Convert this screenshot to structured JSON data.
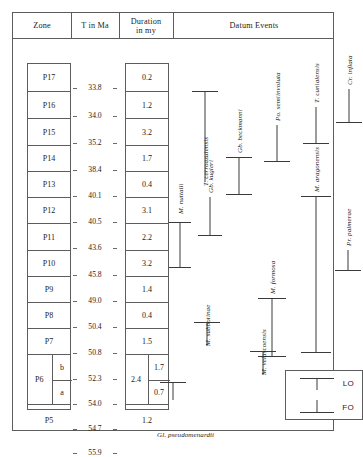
{
  "figure": {
    "kind": "biostratigraphic-zonation-chart"
  },
  "table": {
    "headers": {
      "zone": "Zone",
      "age": "T in Ma",
      "duration": "Duration in my",
      "duration_line1": "Duration",
      "duration_line2": "in my",
      "datum": "Datum Events"
    },
    "zones": [
      {
        "label": "P17",
        "top_ma": 33.8,
        "base_ma": 34.0,
        "duration": "0.2"
      },
      {
        "label": "P16",
        "top_ma": 34.0,
        "base_ma": 35.2,
        "duration": "1.2"
      },
      {
        "label": "P15",
        "top_ma": 35.2,
        "base_ma": 38.4,
        "duration": "3.2"
      },
      {
        "label": "P14",
        "top_ma": 38.4,
        "base_ma": 40.1,
        "duration": "1.7"
      },
      {
        "label": "P13",
        "top_ma": 40.1,
        "base_ma": 40.5,
        "duration": "0.4"
      },
      {
        "label": "P12",
        "top_ma": 40.5,
        "base_ma": 43.6,
        "duration": "3.1"
      },
      {
        "label": "P11",
        "top_ma": 43.6,
        "base_ma": 45.8,
        "duration": "2.2"
      },
      {
        "label": "P10",
        "top_ma": 45.8,
        "base_ma": 49.0,
        "duration": "3.2"
      },
      {
        "label": "P9",
        "top_ma": 49.0,
        "base_ma": 50.4,
        "duration": "1.4"
      },
      {
        "label": "P8",
        "top_ma": 50.4,
        "base_ma": 50.8,
        "duration": "0.4"
      },
      {
        "label": "P7",
        "top_ma": 50.8,
        "base_ma": 52.3,
        "duration": "1.5"
      },
      {
        "label": "P6",
        "top_ma": 52.3,
        "base_ma": 54.7,
        "duration": "2.4",
        "subzones": [
          {
            "label": "b",
            "top_ma": 52.3,
            "base_ma": 54.0,
            "duration": "1.7"
          },
          {
            "label": "a",
            "top_ma": 54.0,
            "base_ma": 54.7,
            "duration": "0.7"
          }
        ]
      },
      {
        "label": "P5",
        "top_ma": 54.7,
        "base_ma": 55.9,
        "duration": "1.2"
      }
    ],
    "age_ticks": [
      "33.8",
      "34.0",
      "35.2",
      "38.4",
      "40.1",
      "40.5",
      "43.6",
      "45.8",
      "49.0",
      "50.4",
      "50.8",
      "52.3",
      "54.0",
      "54.7",
      "55.9"
    ]
  },
  "datum_events": {
    "taxa": [
      {
        "name": "Gl. pseudomenardii",
        "x": 22,
        "top": 357,
        "bottom": 357,
        "cap_top": true,
        "cap_bottom": false,
        "label_y": 404
      },
      {
        "name": "M. nuttalli",
        "x": 32,
        "top": 183,
        "bottom": 228,
        "cap_top": true,
        "cap_bottom": true,
        "label_y": 232
      },
      {
        "name": "M. subbotinae",
        "x": 57,
        "top": 329,
        "bottom": 329,
        "cap_top": true,
        "cap_bottom": false,
        "label_y": 398
      },
      {
        "name": "Gb. kugleri",
        "x": 62,
        "top": 146,
        "bottom": 196,
        "cap_top": true,
        "cap_bottom": true,
        "label_y": 200
      },
      {
        "name": "Gb. beckmanni",
        "x": 88,
        "top": 88,
        "bottom": 155,
        "cap_top": true,
        "cap_bottom": true,
        "label_y": 159
      },
      {
        "name": "M. velascoensis",
        "x": 93,
        "top": 374,
        "bottom": 374,
        "cap_top": true,
        "cap_bottom": false,
        "label_y": 437
      },
      {
        "name": "M. formosa",
        "x": 122,
        "top": 295,
        "bottom": 345,
        "cap_top": true,
        "cap_bottom": true,
        "label_y": 349
      },
      {
        "name": "Po. semiinvoluta",
        "x": 128,
        "top": 57,
        "bottom": 122,
        "cap_top": true,
        "cap_bottom": true,
        "label_y": 126
      },
      {
        "name": "T. cerroazulensis",
        "x": 32,
        "top": 52,
        "bottom": 143,
        "cap_top": true,
        "cap_bottom": false,
        "label_y": 147
      },
      {
        "name": "T. cunialensis",
        "x": 146,
        "top": 50,
        "bottom": 104,
        "cap_top": true,
        "cap_bottom": true,
        "label_y": 108
      },
      {
        "name": "M. aragonensis",
        "x": 155,
        "top": 157,
        "bottom": 313,
        "cap_top": true,
        "cap_bottom": true,
        "label_y": 154
      },
      {
        "name": "Pr. palmerae",
        "x": 180,
        "top": 231,
        "bottom": 231,
        "cap_top": true,
        "cap_bottom": false,
        "label_y": 292
      },
      {
        "name": "Cr. inflata",
        "x": 188,
        "top": 43,
        "bottom": 83,
        "cap_top": true,
        "cap_bottom": true,
        "label_y": 87
      }
    ]
  },
  "legend": {
    "items": [
      {
        "code": "LO",
        "meaning": "last occurrence"
      },
      {
        "code": "FO",
        "meaning": "first occurrence"
      }
    ]
  },
  "colors": {
    "ink": "#1c1c1c",
    "rule": "#5c5c5c",
    "bar": "#3a3a3a",
    "background": "#ffffff"
  }
}
